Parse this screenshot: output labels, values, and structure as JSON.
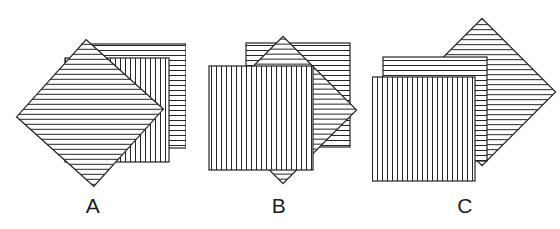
{
  "figure": {
    "background_color": "#ffffff",
    "stroke_color": "#222222",
    "panel_count": 3
  },
  "style": {
    "line_color": "#242424",
    "line_width": 1,
    "border_width": 1.2,
    "stripe_spacing": 5,
    "fill_color": "#ffffff"
  },
  "textures": {
    "horizontal": "horizontal-stripes",
    "vertical": "vertical-stripes",
    "diagonal": "diagonal-stripes"
  },
  "panels": [
    {
      "id": "A",
      "label": "A",
      "label_x": 118,
      "label_y": 210,
      "stacking_order_back_to_front": [
        "horizontal",
        "vertical",
        "diagonal"
      ],
      "squares": [
        {
          "name": "horizontal-square",
          "texture": "horizontal",
          "depth": "back",
          "x": 82,
          "y": 44,
          "size": 104,
          "rotation": 0
        },
        {
          "name": "vertical-square",
          "texture": "vertical",
          "depth": "middle",
          "x": 65,
          "y": 58,
          "size": 104,
          "rotation": 0
        },
        {
          "name": "diagonal-square",
          "texture": "diagonal",
          "depth": "front",
          "cx": 90,
          "cy": 113,
          "size": 104,
          "rotation": 42
        }
      ]
    },
    {
      "id": "B",
      "label": "B",
      "label_x": 265,
      "label_y": 210,
      "stacking_order_back_to_front": [
        "horizontal",
        "diagonal",
        "vertical"
      ],
      "squares": [
        {
          "name": "horizontal-square",
          "texture": "horizontal",
          "depth": "back",
          "x": 60,
          "y": 43,
          "size": 104,
          "rotation": 0
        },
        {
          "name": "diagonal-square",
          "texture": "diagonal",
          "depth": "middle",
          "cx": 97,
          "cy": 110,
          "size": 104,
          "rotation": 45
        },
        {
          "name": "vertical-square",
          "texture": "vertical",
          "depth": "front",
          "x": 23,
          "y": 66,
          "size": 104,
          "rotation": 0
        }
      ]
    },
    {
      "id": "C",
      "label": "C",
      "label_x": 415,
      "label_y": 210,
      "stacking_order_back_to_front": [
        "diagonal",
        "horizontal",
        "vertical"
      ],
      "squares": [
        {
          "name": "diagonal-square",
          "texture": "diagonal",
          "depth": "back",
          "cx": 110,
          "cy": 92,
          "size": 104,
          "rotation": 45
        },
        {
          "name": "horizontal-square",
          "texture": "horizontal",
          "depth": "middle",
          "x": 11,
          "y": 57,
          "size": 104,
          "rotation": 0
        },
        {
          "name": "vertical-square",
          "texture": "vertical",
          "depth": "front",
          "x": -1,
          "y": 77,
          "size": 104,
          "rotation": 0
        }
      ]
    }
  ]
}
